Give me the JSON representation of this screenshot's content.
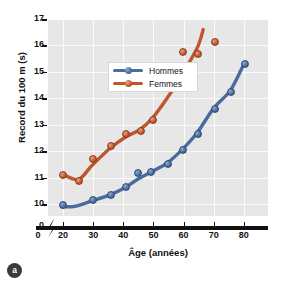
{
  "figure": {
    "panel_label": "a"
  },
  "chart_data": {
    "type": "line",
    "title": "",
    "xlabel": "Âge (années)",
    "ylabel": "Record du 100 m (s)",
    "xlim": [
      15,
      88
    ],
    "ylim": [
      9.55,
      17.0
    ],
    "axis_break_x": true,
    "axis_break_y": true,
    "grid": true,
    "legend_position": "upper-left-inside",
    "xticks": [
      0,
      20,
      30,
      40,
      50,
      60,
      70,
      80
    ],
    "xtick_labels": [
      "0",
      "20",
      "30",
      "40",
      "50",
      "60",
      "70",
      "80"
    ],
    "yticks": [
      0,
      10,
      11,
      12,
      13,
      14,
      15,
      16,
      17
    ],
    "ytick_labels": [
      "0",
      "10",
      "11",
      "12",
      "13",
      "14",
      "15",
      "16",
      "17"
    ],
    "series": [
      {
        "name": "Hommes",
        "color": "#4a6b9e",
        "points": [
          {
            "x": 19.5,
            "y": 10.0
          },
          {
            "x": 29.5,
            "y": 10.2
          },
          {
            "x": 35.5,
            "y": 10.37
          },
          {
            "x": 40.5,
            "y": 10.68
          },
          {
            "x": 44.5,
            "y": 11.2
          },
          {
            "x": 49.0,
            "y": 11.24
          },
          {
            "x": 54.5,
            "y": 11.57
          },
          {
            "x": 59.5,
            "y": 12.08
          },
          {
            "x": 64.5,
            "y": 12.7
          },
          {
            "x": 70.0,
            "y": 13.65
          },
          {
            "x": 75.5,
            "y": 14.28
          },
          {
            "x": 80.0,
            "y": 15.33
          }
        ],
        "fit_curve": [
          {
            "x": 19.5,
            "y": 9.9
          },
          {
            "x": 24.0,
            "y": 9.92
          },
          {
            "x": 29.5,
            "y": 10.12
          },
          {
            "x": 35.5,
            "y": 10.35
          },
          {
            "x": 40.5,
            "y": 10.62
          },
          {
            "x": 44.5,
            "y": 10.92
          },
          {
            "x": 49.0,
            "y": 11.2
          },
          {
            "x": 54.5,
            "y": 11.55
          },
          {
            "x": 59.5,
            "y": 12.06
          },
          {
            "x": 64.5,
            "y": 12.7
          },
          {
            "x": 70.0,
            "y": 13.63
          },
          {
            "x": 75.5,
            "y": 14.3
          },
          {
            "x": 80.0,
            "y": 15.3
          }
        ]
      },
      {
        "name": "Femmes",
        "color": "#c0562e",
        "points": [
          {
            "x": 19.5,
            "y": 11.15
          },
          {
            "x": 25.0,
            "y": 10.93
          },
          {
            "x": 29.5,
            "y": 11.73
          },
          {
            "x": 35.5,
            "y": 12.24
          },
          {
            "x": 40.5,
            "y": 12.68
          },
          {
            "x": 45.5,
            "y": 12.8
          },
          {
            "x": 49.5,
            "y": 13.23
          },
          {
            "x": 54.5,
            "y": 14.57
          },
          {
            "x": 59.5,
            "y": 15.8
          },
          {
            "x": 64.5,
            "y": 15.7
          },
          {
            "x": 70.0,
            "y": 16.16
          }
        ],
        "fit_curve": [
          {
            "x": 19.5,
            "y": 11.15
          },
          {
            "x": 25.0,
            "y": 10.93
          },
          {
            "x": 29.5,
            "y": 11.45
          },
          {
            "x": 35.5,
            "y": 12.1
          },
          {
            "x": 40.5,
            "y": 12.52
          },
          {
            "x": 45.5,
            "y": 12.82
          },
          {
            "x": 49.5,
            "y": 13.23
          },
          {
            "x": 54.5,
            "y": 14.0
          },
          {
            "x": 59.5,
            "y": 14.9
          },
          {
            "x": 64.5,
            "y": 15.9
          },
          {
            "x": 66.5,
            "y": 16.6
          }
        ]
      }
    ]
  }
}
